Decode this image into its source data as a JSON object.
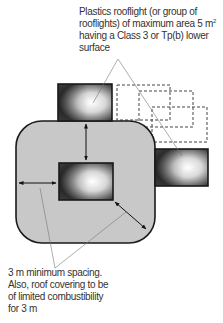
{
  "diagram": {
    "top_label": {
      "line1": "Plastics rooflight (or group of",
      "line2a": "rooflights) of maximum area 5 m",
      "line2_sup": "2",
      "line3": "having a Class 3 or Tp(b) lower",
      "line4": "surface"
    },
    "bottom_label": {
      "line1": "3 m minimum spacing.",
      "line2": "Also, roof covering to be",
      "line3": "of limited combustibility",
      "line4": "for 3 m"
    },
    "colors": {
      "zone_fill": "#c8c8c8",
      "outline": "#1a1a1a",
      "dashed": "#444444",
      "leader": "#666666"
    },
    "elements": [
      "rooflight-top",
      "rooflight-center",
      "rooflight-right",
      "dashed-rooflight-group",
      "limited-combustibility-zone",
      "spacing-arrows"
    ]
  }
}
